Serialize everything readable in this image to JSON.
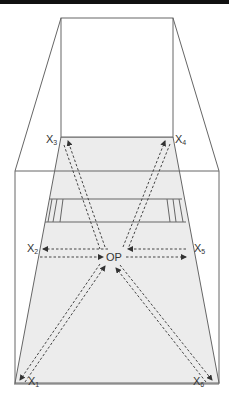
{
  "diagram": {
    "type": "perspective room diagram",
    "colors": {
      "line": "#666666",
      "floor": "#ececec",
      "arrow": "#444444",
      "topbar": "#111111"
    },
    "labels": {
      "x1": {
        "main": "X",
        "sub": "1"
      },
      "x2": {
        "main": "X",
        "sub": "2"
      },
      "x3": {
        "main": "X",
        "sub": "3"
      },
      "x4": {
        "main": "X",
        "sub": "4"
      },
      "x5": {
        "main": "X",
        "sub": "5"
      },
      "x6": {
        "main": "X",
        "sub": "6"
      },
      "center": "OP"
    }
  }
}
